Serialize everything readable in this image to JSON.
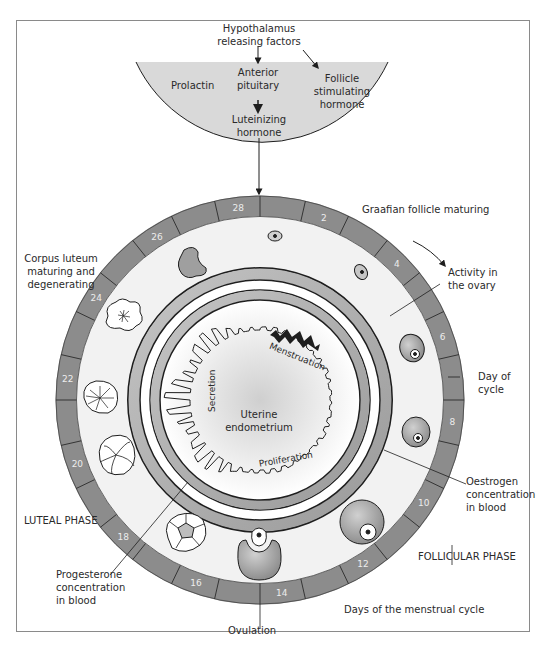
{
  "hormones": {
    "hypothalamus": "Hypothalamus\nreleasing factors",
    "anterior_pituitary": "Anterior\npituitary",
    "prolactin": "Prolactin",
    "fsh": "Follicle\nstimulating\nhormone",
    "lh": "Luteinizing\nhormone"
  },
  "labels": {
    "graafian": "Graafian follicle maturing",
    "activity_ovary": "Activity in\nthe ovary",
    "day_of_cycle": "Day of\ncycle",
    "oestrogen": "Oestrogen\nconcentration\nin blood",
    "follicular_phase": "FOLLICULAR PHASE",
    "days_menstrual": "Days of the menstrual cycle",
    "ovulation": "Ovulation",
    "progesterone": "Progesterone\nconcentration\nin blood",
    "luteal_phase": "LUTEAL PHASE",
    "corpus_luteum": "Corpus luteum\nmaturing and\ndegenerating",
    "uterine": "Uterine\nendometrium",
    "menstruation": "Menstruation",
    "proliferation": "Proliferation",
    "secretion": "Secretion"
  },
  "cycle": {
    "total_days": 28,
    "day_labels": [
      "2",
      "4",
      "6",
      "8",
      "10",
      "12",
      "14",
      "16",
      "18",
      "20",
      "22",
      "24",
      "26",
      "28"
    ]
  },
  "colors": {
    "ring": "#8c8c8c",
    "band": "#a9a9a9",
    "pituitary": "#d9d9d9",
    "outline": "#1e1e1e",
    "disc": "#f2f2f2"
  },
  "caption": "Figure: Diagram of the menstrual cycle showing ovarian activity and endometrium changes"
}
